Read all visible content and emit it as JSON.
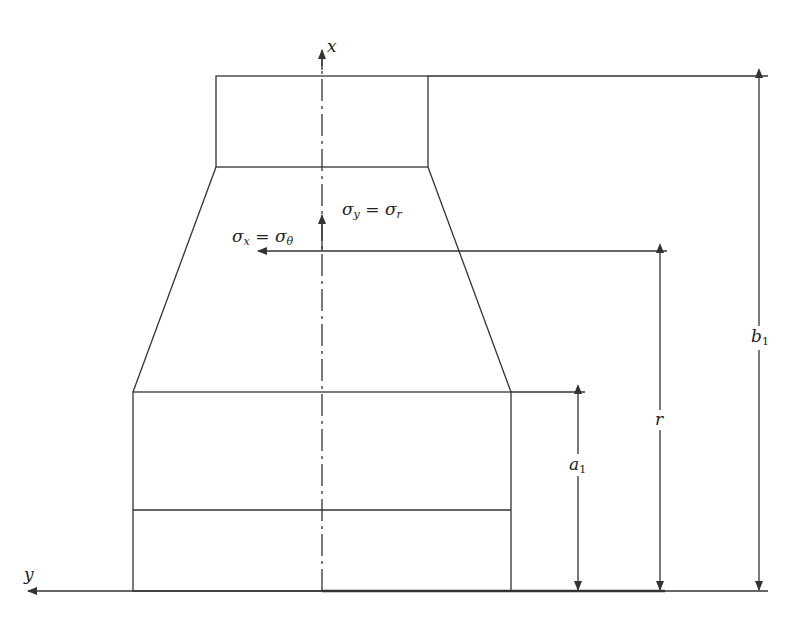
{
  "diagram": {
    "type": "stepped-tapered-cylinder-cross-section",
    "stroke_color": "#333333",
    "axes": {
      "x_label": "x",
      "y_label": "y"
    },
    "stresses": {
      "sigma_y": {
        "symbol": "σ",
        "sub": "y",
        "eq": "=",
        "rhs_symbol": "σ",
        "rhs_sub": "r"
      },
      "sigma_x": {
        "symbol": "σ",
        "sub": "x",
        "eq": "=",
        "rhs_symbol": "σ",
        "rhs_sub": "θ"
      }
    },
    "dimensions": {
      "a1": {
        "symbol": "a",
        "sub": "1"
      },
      "r": {
        "symbol": "r"
      },
      "b1": {
        "symbol": "b",
        "sub": "1"
      }
    }
  }
}
